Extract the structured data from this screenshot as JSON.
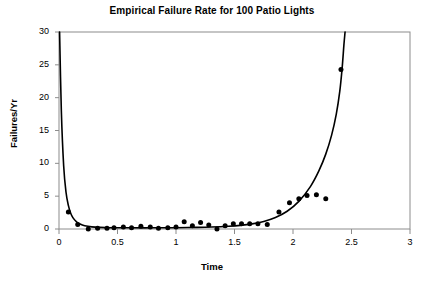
{
  "chart_data": {
    "type": "scatter",
    "title": "Empirical Failure Rate for 100 Patio Lights",
    "xlabel": "Time",
    "ylabel": "Failures/Yr",
    "xlim": [
      0,
      3
    ],
    "ylim": [
      0,
      30
    ],
    "xticks": [
      0,
      0.5,
      1,
      1.5,
      2,
      2.5,
      3
    ],
    "xtick_labels": [
      "0",
      "0.5",
      "1",
      "1.5",
      "2",
      "2.5",
      "3"
    ],
    "yticks": [
      0,
      5,
      10,
      15,
      20,
      25,
      30
    ],
    "ytick_labels": [
      "0",
      "5",
      "10",
      "15",
      "20",
      "25",
      "30"
    ],
    "grid": false,
    "legend": null,
    "series": [
      {
        "name": "Empirical failure rate",
        "type": "scatter",
        "marker": "filled-circle",
        "color": "#000000",
        "points": [
          [
            0.08,
            2.6
          ],
          [
            0.16,
            0.7
          ],
          [
            0.25,
            0.0
          ],
          [
            0.33,
            0.1
          ],
          [
            0.41,
            0.1
          ],
          [
            0.47,
            0.2
          ],
          [
            0.55,
            0.3
          ],
          [
            0.62,
            0.2
          ],
          [
            0.7,
            0.4
          ],
          [
            0.78,
            0.3
          ],
          [
            0.85,
            0.1
          ],
          [
            0.93,
            0.2
          ],
          [
            1.0,
            0.3
          ],
          [
            1.07,
            1.1
          ],
          [
            1.14,
            0.5
          ],
          [
            1.21,
            1.0
          ],
          [
            1.28,
            0.6
          ],
          [
            1.35,
            0.0
          ],
          [
            1.42,
            0.5
          ],
          [
            1.49,
            0.8
          ],
          [
            1.56,
            0.8
          ],
          [
            1.63,
            0.8
          ],
          [
            1.7,
            0.8
          ],
          [
            1.78,
            0.7
          ],
          [
            1.88,
            2.6
          ],
          [
            1.97,
            4.0
          ],
          [
            2.05,
            4.6
          ],
          [
            2.12,
            5.1
          ],
          [
            2.2,
            5.2
          ],
          [
            2.28,
            4.6
          ],
          [
            2.41,
            24.3
          ]
        ]
      },
      {
        "name": "Fitted bathtub curve",
        "type": "line",
        "color": "#000000",
        "points": [
          [
            0.005,
            30.0
          ],
          [
            0.02,
            18.0
          ],
          [
            0.04,
            9.6
          ],
          [
            0.06,
            5.6
          ],
          [
            0.08,
            3.6
          ],
          [
            0.1,
            2.4
          ],
          [
            0.12,
            1.7
          ],
          [
            0.15,
            1.1
          ],
          [
            0.18,
            0.75
          ],
          [
            0.22,
            0.5
          ],
          [
            0.28,
            0.33
          ],
          [
            0.35,
            0.25
          ],
          [
            0.45,
            0.2
          ],
          [
            0.6,
            0.18
          ],
          [
            0.8,
            0.18
          ],
          [
            1.0,
            0.2
          ],
          [
            1.15,
            0.24
          ],
          [
            1.3,
            0.3
          ],
          [
            1.45,
            0.42
          ],
          [
            1.55,
            0.55
          ],
          [
            1.65,
            0.78
          ],
          [
            1.75,
            1.15
          ],
          [
            1.85,
            1.75
          ],
          [
            1.95,
            2.7
          ],
          [
            2.05,
            4.2
          ],
          [
            2.15,
            6.5
          ],
          [
            2.22,
            8.8
          ],
          [
            2.28,
            11.4
          ],
          [
            2.33,
            14.3
          ],
          [
            2.37,
            17.5
          ],
          [
            2.4,
            21.0
          ],
          [
            2.42,
            24.5
          ],
          [
            2.435,
            28.0
          ],
          [
            2.445,
            30.0
          ]
        ]
      }
    ]
  }
}
